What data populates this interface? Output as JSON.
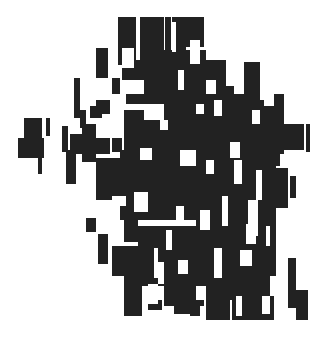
{
  "artwork": {
    "background": "#ffffff",
    "ink": "#222222",
    "dark": [
      [
        118,
        17,
        18,
        48
      ],
      [
        140,
        17,
        24,
        44
      ],
      [
        165,
        17,
        6,
        40
      ],
      [
        172,
        17,
        14,
        52
      ],
      [
        184,
        17,
        20,
        30
      ],
      [
        96,
        48,
        12,
        30
      ],
      [
        122,
        66,
        14,
        14
      ],
      [
        132,
        60,
        32,
        20
      ],
      [
        146,
        50,
        60,
        40
      ],
      [
        206,
        60,
        20,
        40
      ],
      [
        112,
        78,
        8,
        16
      ],
      [
        140,
        78,
        40,
        24
      ],
      [
        180,
        66,
        46,
        34
      ],
      [
        244,
        62,
        16,
        40
      ],
      [
        74,
        78,
        6,
        40
      ],
      [
        126,
        94,
        50,
        10
      ],
      [
        164,
        86,
        70,
        50
      ],
      [
        226,
        94,
        34,
        50
      ],
      [
        274,
        94,
        10,
        60
      ],
      [
        96,
        100,
        14,
        14
      ],
      [
        80,
        110,
        6,
        18
      ],
      [
        90,
        106,
        12,
        12
      ],
      [
        234,
        100,
        30,
        40
      ],
      [
        24,
        118,
        18,
        22
      ],
      [
        18,
        138,
        26,
        20
      ],
      [
        46,
        118,
        4,
        18
      ],
      [
        62,
        126,
        6,
        26
      ],
      [
        82,
        124,
        14,
        38
      ],
      [
        70,
        134,
        24,
        20
      ],
      [
        96,
        138,
        14,
        16
      ],
      [
        112,
        138,
        10,
        14
      ],
      [
        124,
        110,
        20,
        40
      ],
      [
        142,
        120,
        50,
        50
      ],
      [
        190,
        106,
        90,
        60
      ],
      [
        284,
        124,
        20,
        26
      ],
      [
        306,
        124,
        4,
        28
      ],
      [
        38,
        156,
        4,
        18
      ],
      [
        66,
        150,
        10,
        34
      ],
      [
        96,
        158,
        24,
        42
      ],
      [
        120,
        150,
        80,
        70
      ],
      [
        196,
        150,
        80,
        90
      ],
      [
        290,
        176,
        6,
        22
      ],
      [
        268,
        168,
        20,
        40
      ],
      [
        86,
        218,
        10,
        14
      ],
      [
        98,
        234,
        10,
        30
      ],
      [
        124,
        218,
        14,
        24
      ],
      [
        112,
        246,
        40,
        30
      ],
      [
        138,
        226,
        90,
        60
      ],
      [
        226,
        226,
        50,
        70
      ],
      [
        230,
        260,
        40,
        40
      ],
      [
        124,
        276,
        18,
        40
      ],
      [
        148,
        300,
        14,
        10
      ],
      [
        164,
        276,
        40,
        30
      ],
      [
        174,
        300,
        16,
        14
      ],
      [
        190,
        296,
        10,
        20
      ],
      [
        206,
        276,
        24,
        44
      ],
      [
        232,
        290,
        42,
        30
      ],
      [
        258,
        306,
        16,
        14
      ],
      [
        288,
        258,
        8,
        50
      ],
      [
        296,
        290,
        12,
        30
      ]
    ],
    "light": [
      [
        122,
        48,
        12,
        20
      ],
      [
        134,
        80,
        10,
        14
      ],
      [
        178,
        70,
        6,
        20
      ],
      [
        190,
        40,
        10,
        24
      ],
      [
        172,
        22,
        4,
        30
      ],
      [
        206,
        80,
        10,
        14
      ],
      [
        214,
        100,
        8,
        16
      ],
      [
        196,
        104,
        8,
        10
      ],
      [
        252,
        110,
        8,
        14
      ],
      [
        110,
        112,
        10,
        10
      ],
      [
        160,
        120,
        8,
        10
      ],
      [
        140,
        148,
        12,
        12
      ],
      [
        180,
        150,
        16,
        16
      ],
      [
        206,
        160,
        8,
        14
      ],
      [
        230,
        142,
        10,
        16
      ],
      [
        234,
        160,
        8,
        24
      ],
      [
        256,
        170,
        6,
        30
      ],
      [
        248,
        200,
        10,
        36
      ],
      [
        112,
        196,
        14,
        10
      ],
      [
        134,
        192,
        14,
        20
      ],
      [
        176,
        206,
        8,
        16
      ],
      [
        200,
        210,
        10,
        20
      ],
      [
        222,
        196,
        6,
        30
      ],
      [
        246,
        224,
        10,
        20
      ],
      [
        240,
        250,
        12,
        16
      ],
      [
        166,
        230,
        6,
        20
      ],
      [
        214,
        248,
        8,
        30
      ],
      [
        158,
        262,
        6,
        22
      ],
      [
        178,
        260,
        10,
        14
      ],
      [
        148,
        284,
        10,
        20
      ],
      [
        196,
        286,
        10,
        14
      ],
      [
        236,
        296,
        6,
        20
      ],
      [
        262,
        296,
        8,
        18
      ],
      [
        270,
        276,
        6,
        20
      ],
      [
        154,
        248,
        4,
        30
      ],
      [
        266,
        226,
        4,
        20
      ]
    ]
  }
}
